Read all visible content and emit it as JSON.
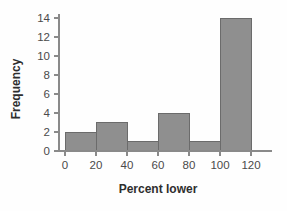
{
  "chart_data": {
    "type": "bar",
    "title": "",
    "xlabel": "Percent lower",
    "ylabel": "Frequency",
    "categories": [
      "0-20",
      "20-40",
      "40-60",
      "60-80",
      "80-100",
      "100-120"
    ],
    "bin_edges": [
      0,
      20,
      40,
      60,
      80,
      100,
      120
    ],
    "values": [
      2,
      3,
      1,
      4,
      1,
      14
    ],
    "xlim": [
      0,
      120
    ],
    "ylim": [
      0,
      14
    ],
    "xticks": [
      "0",
      "20",
      "40",
      "60",
      "80",
      "100",
      "120"
    ],
    "yticks": [
      "0",
      "2",
      "4",
      "6",
      "8",
      "10",
      "12",
      "14"
    ],
    "grid": false,
    "legend": false,
    "bar_fill_color": "#8f8f8f",
    "bar_edge_color": "#6b6b6b",
    "axis_color": "#8a8a8a",
    "background_color": "#fefefe"
  }
}
